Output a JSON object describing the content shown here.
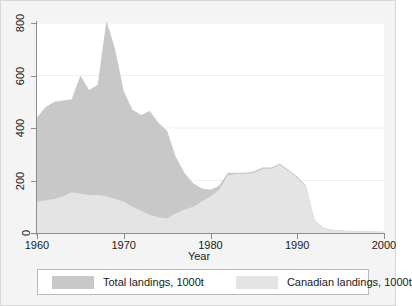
{
  "figure": {
    "background_color": "#f4f4f4",
    "plot_background_color": "#ffffff",
    "axis_color": "#8d8d8d",
    "gridline_color": "#f0f0f0"
  },
  "legend": {
    "entries": [
      {
        "label": "Total landings, 1000t",
        "color": "#c8c8c8",
        "swatch_name": "total-landings-swatch"
      },
      {
        "label": "Canadian landings, 1000t",
        "color": "#e4e4e4",
        "swatch_name": "canadian-landings-swatch"
      }
    ]
  },
  "chart_data": {
    "type": "area",
    "title": "",
    "subtitle": "",
    "xlabel": "Year",
    "ylabel": "",
    "xlim": [
      1960,
      2000
    ],
    "ylim": [
      0,
      800
    ],
    "xticks": [
      1960,
      1970,
      1980,
      1990,
      2000
    ],
    "yticks": [
      0,
      200,
      400,
      600,
      800
    ],
    "xtick_labels": [
      "1960",
      "1970",
      "1980",
      "1990",
      "2000"
    ],
    "ytick_labels": [
      "0",
      "200",
      "400",
      "600",
      "800"
    ],
    "grid": true,
    "grid_axis": "y",
    "legend_position": "below-axis",
    "stacked": false,
    "overlay_order": [
      "Total landings, 1000t",
      "Canadian landings, 1000t"
    ],
    "x": [
      1960,
      1961,
      1962,
      1963,
      1964,
      1965,
      1966,
      1967,
      1968,
      1969,
      1970,
      1971,
      1972,
      1973,
      1974,
      1975,
      1976,
      1977,
      1978,
      1979,
      1980,
      1981,
      1982,
      1983,
      1984,
      1985,
      1986,
      1987,
      1988,
      1989,
      1990,
      1991,
      1992,
      1993,
      1994,
      1995,
      1996,
      1997,
      1998,
      1999,
      2000
    ],
    "series": [
      {
        "name": "Total landings, 1000t",
        "color": "#c8c8c8",
        "values": [
          440,
          480,
          500,
          505,
          510,
          600,
          545,
          565,
          810,
          700,
          540,
          470,
          450,
          465,
          420,
          390,
          290,
          230,
          190,
          170,
          165,
          180,
          230,
          230,
          230,
          235,
          250,
          250,
          265,
          240,
          215,
          180,
          50,
          20,
          12,
          10,
          9,
          8,
          7,
          6,
          5
        ]
      },
      {
        "name": "Canadian landings, 1000t",
        "color": "#e4e4e4",
        "values": [
          120,
          125,
          130,
          140,
          155,
          150,
          145,
          145,
          140,
          130,
          120,
          100,
          85,
          70,
          60,
          55,
          75,
          90,
          100,
          120,
          140,
          165,
          220,
          225,
          225,
          230,
          245,
          245,
          260,
          235,
          210,
          175,
          48,
          18,
          11,
          9,
          8,
          7,
          6,
          5,
          4
        ]
      }
    ],
    "annotations": []
  }
}
